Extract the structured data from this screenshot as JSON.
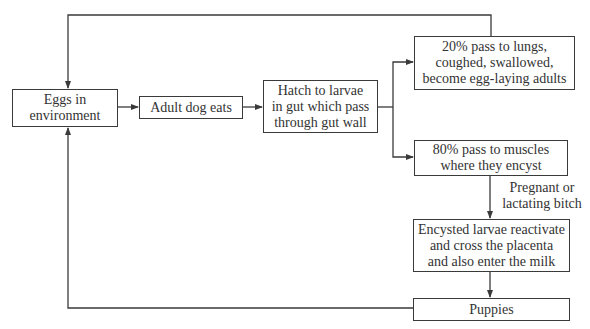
{
  "diagram": {
    "type": "flowchart",
    "title": "",
    "nodes": [
      {
        "id": "eggs",
        "label": "Eggs in\nenvironment"
      },
      {
        "id": "adult_eats",
        "label": "Adult dog eats"
      },
      {
        "id": "hatch",
        "label": "Hatch to larvae\nin gut which pass\nthrough gut wall"
      },
      {
        "id": "lungs",
        "label": "20% pass to lungs,\ncoughed, swallowed,\nbecome egg-laying adults"
      },
      {
        "id": "muscles",
        "label": "80% pass to muscles\nwhere they encyst"
      },
      {
        "id": "reactivate",
        "label": "Encysted larvae reactivate\nand cross the placenta\nand also enter the milk"
      },
      {
        "id": "puppies",
        "label": "Puppies"
      }
    ],
    "edge_labels": {
      "muscles_to_reactivate": "Pregnant or\nlactating bitch"
    },
    "edges": [
      {
        "from": "eggs",
        "to": "adult_eats"
      },
      {
        "from": "adult_eats",
        "to": "hatch"
      },
      {
        "from": "hatch",
        "to": "lungs"
      },
      {
        "from": "hatch",
        "to": "muscles"
      },
      {
        "from": "lungs",
        "to": "eggs"
      },
      {
        "from": "muscles",
        "to": "reactivate",
        "label": "Pregnant or\nlactating bitch"
      },
      {
        "from": "reactivate",
        "to": "puppies"
      },
      {
        "from": "puppies",
        "to": "eggs"
      }
    ],
    "colors": {
      "line": "#3a3a3a",
      "text": "#333333",
      "background": "#ffffff"
    }
  }
}
